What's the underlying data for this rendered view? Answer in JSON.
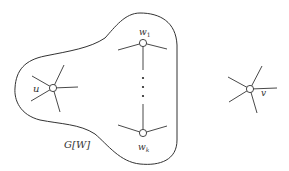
{
  "diagram": {
    "type": "graph-illustration",
    "region": {
      "label": "G[W]"
    },
    "nodes": [
      {
        "id": "u",
        "label": "u",
        "inside_region": true
      },
      {
        "id": "w1",
        "label": "w",
        "subscript": "1",
        "inside_region": true
      },
      {
        "id": "wk",
        "label": "w",
        "subscript": "k",
        "inside_region": true
      },
      {
        "id": "v",
        "label": "v",
        "inside_region": false
      }
    ],
    "ellipsis": "vertical dots between w1 and wk",
    "colors": {
      "stroke": "#333333",
      "background": "#ffffff"
    }
  }
}
